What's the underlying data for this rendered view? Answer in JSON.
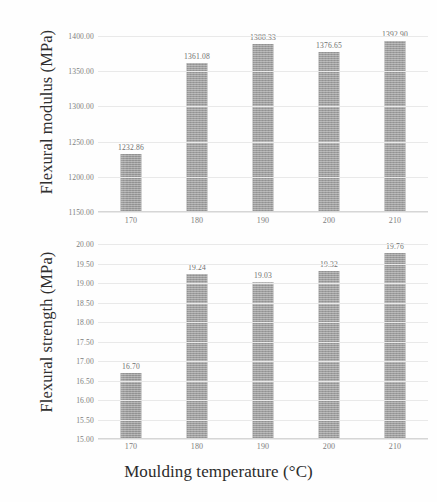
{
  "figure": {
    "background": "#fefefe",
    "bar_color": "#9d9d9d",
    "text_color": "#4a4a4a",
    "xlabel": "Moulding temperature (°C)"
  },
  "chart_data": [
    {
      "type": "bar",
      "id": "flexural-modulus",
      "title": "",
      "xlabel": "Moulding temperature (°C)",
      "ylabel": "Flexural modulus (MPa)",
      "categories": [
        "170",
        "180",
        "190",
        "200",
        "210"
      ],
      "values": [
        1232.86,
        1361.08,
        1388.33,
        1376.65,
        1392.9
      ],
      "data_labels": [
        "1232.86",
        "1361.08",
        "1388.33",
        "1376.65",
        "1392.90"
      ],
      "ylim": [
        1150.0,
        1400.0
      ],
      "ytick_step": 50,
      "ytick_labels": [
        "1400.00",
        "1350.00",
        "1300.00",
        "1250.00",
        "1200.00",
        "1150.00"
      ],
      "ytick_values": [
        1400,
        1350,
        1300,
        1250,
        1200,
        1150
      ],
      "grid": true,
      "legend": "none",
      "bar_color": "#9d9d9d"
    },
    {
      "type": "bar",
      "id": "flexural-strength",
      "title": "",
      "xlabel": "Moulding temperature (°C)",
      "ylabel": "Flexural strength (MPa)",
      "categories": [
        "170",
        "180",
        "190",
        "200",
        "210"
      ],
      "values": [
        16.7,
        19.24,
        19.03,
        19.32,
        19.76
      ],
      "data_labels": [
        "16.70",
        "19.24",
        "19.03",
        "19.32",
        "19.76"
      ],
      "ylim": [
        15.0,
        20.0
      ],
      "ytick_step": 0.5,
      "ytick_labels": [
        "20.00",
        "19.50",
        "19.00",
        "18.50",
        "18.00",
        "17.50",
        "17.00",
        "16.50",
        "16.00",
        "15.50",
        "15.00"
      ],
      "ytick_values": [
        20.0,
        19.5,
        19.0,
        18.5,
        18.0,
        17.5,
        17.0,
        16.5,
        16.0,
        15.5,
        15.0
      ],
      "grid": true,
      "legend": "none",
      "bar_color": "#9d9d9d"
    }
  ]
}
